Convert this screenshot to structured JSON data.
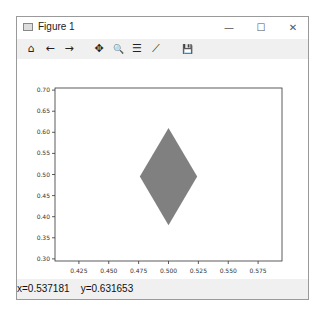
{
  "window": {
    "title": "Figure 1",
    "minimize_label": "—",
    "maximize_label": "☐",
    "close_label": "✕"
  },
  "toolbar": {
    "home": "⌂",
    "back": "←",
    "forward": "→",
    "pan": "✥",
    "zoom": "🔍",
    "configure": "☰",
    "edit": "⟋",
    "save": "💾"
  },
  "status": {
    "x_text": "x=0.537181",
    "y_text": "y=0.631653"
  },
  "chart_data": {
    "type": "polygon",
    "title": "",
    "xlabel": "",
    "ylabel": "",
    "xlim": [
      0.405,
      0.595
    ],
    "ylim": [
      0.295,
      0.705
    ],
    "xticks": [
      "0.425",
      "0.450",
      "0.475",
      "0.500",
      "0.525",
      "0.550",
      "0.575"
    ],
    "yticks": [
      "0.30",
      "0.35",
      "0.40",
      "0.45",
      "0.50",
      "0.55",
      "0.60",
      "0.65",
      "0.70"
    ],
    "grid": false,
    "series": [
      {
        "name": "diamond",
        "fill": "#808080",
        "points": [
          [
            0.5,
            0.61
          ],
          [
            0.524,
            0.495
          ],
          [
            0.5,
            0.38
          ],
          [
            0.476,
            0.495
          ]
        ]
      }
    ]
  }
}
